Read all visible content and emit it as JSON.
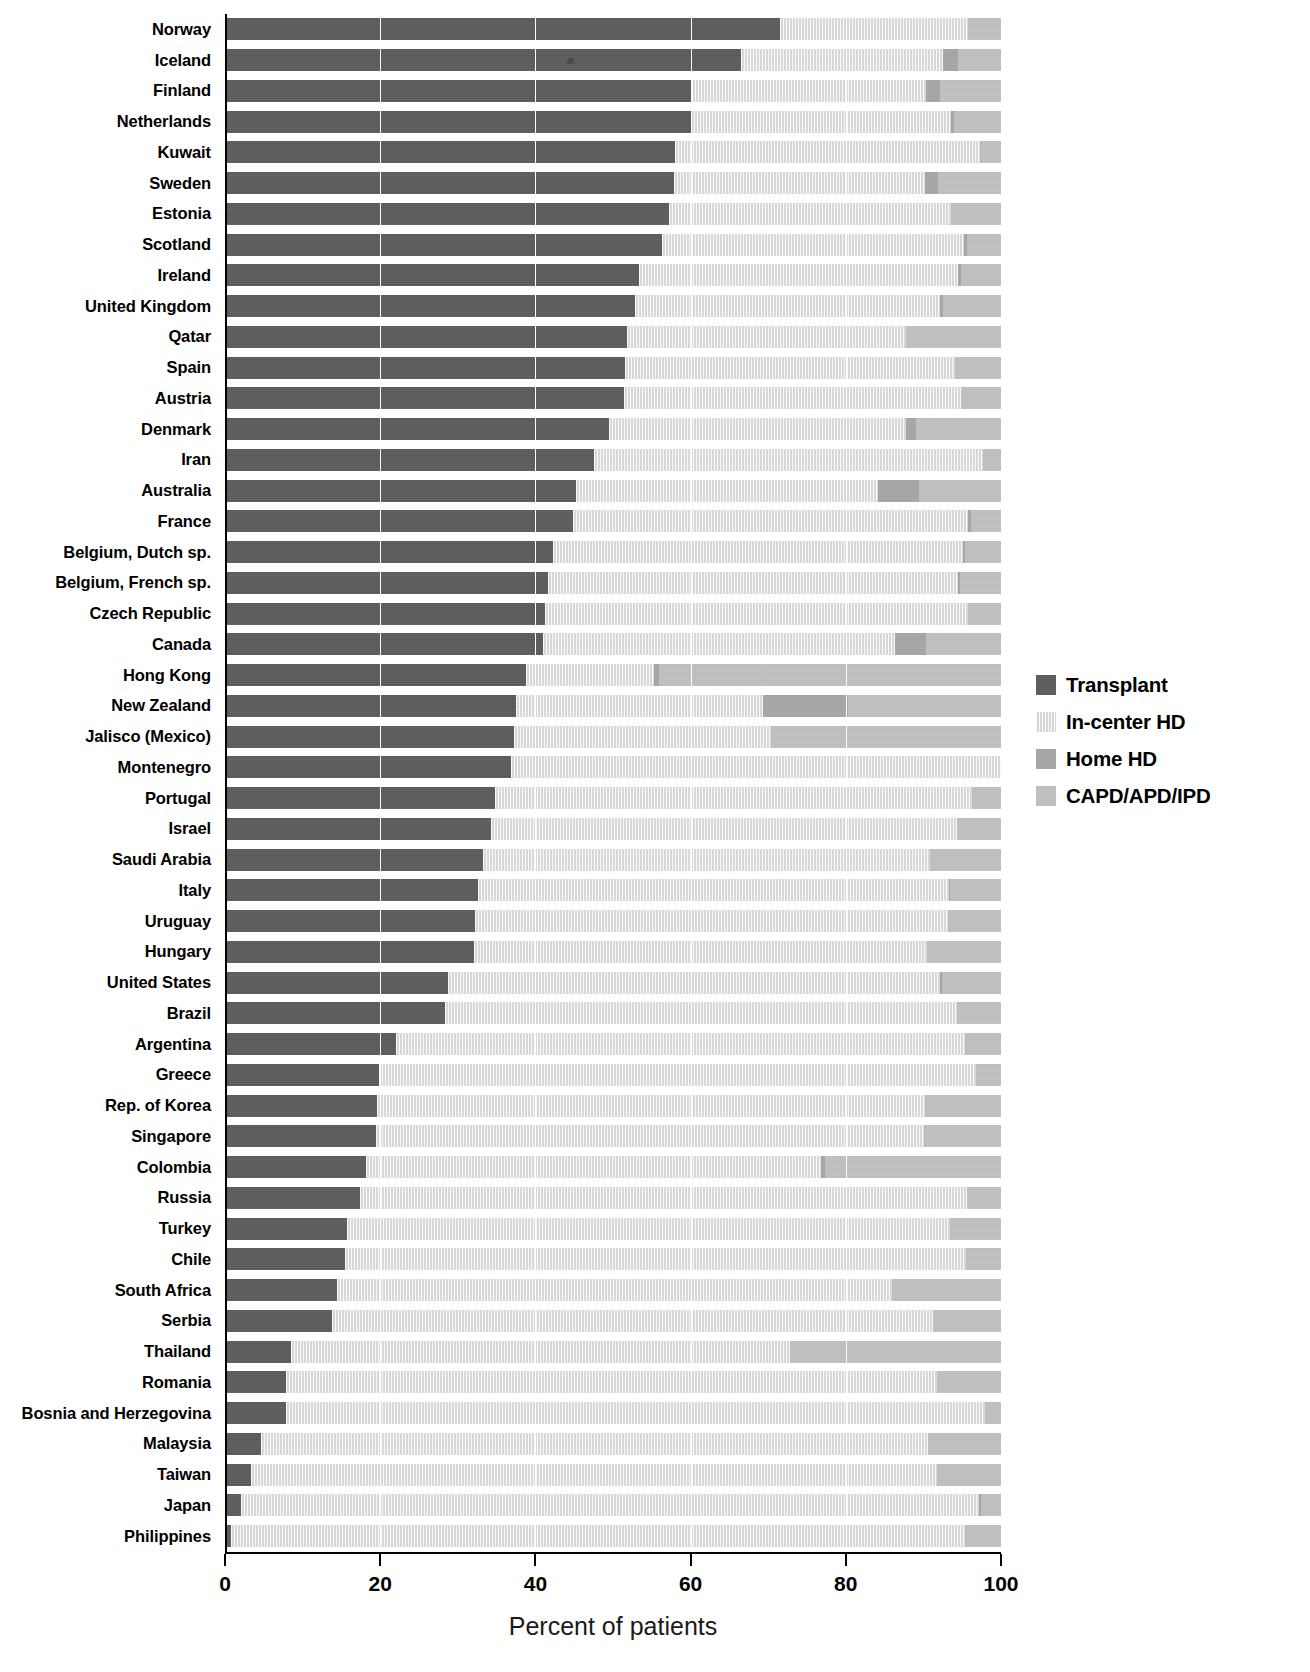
{
  "chart_data": {
    "type": "bar",
    "subtype": "horizontal-stacked-100",
    "title": "",
    "xlabel": "Percent of patients",
    "ylabel": "",
    "xlim": [
      0,
      100
    ],
    "xticks": [
      0,
      20,
      40,
      60,
      80,
      100
    ],
    "grid": true,
    "legend_position": "right",
    "stacked": true,
    "series": [
      {
        "name": "Transplant",
        "color": "#595959",
        "values": [
          71.5,
          66.5,
          60.2,
          60.0,
          58.0,
          57.8,
          57.5,
          56.3,
          53.4,
          52.8,
          51.8,
          51.6,
          51.4,
          49.5,
          47.5,
          45.2,
          44.8,
          42.3,
          41.6,
          41.2,
          41.0,
          38.8,
          37.5,
          37.3,
          36.8,
          34.8,
          34.3,
          33.3,
          32.6,
          32.2,
          32.1,
          28.7,
          28.3,
          22.0,
          19.9,
          19.6,
          19.4,
          18.2,
          17.4,
          15.7,
          15.4,
          14.4,
          13.8,
          8.5,
          7.9,
          7.8,
          4.6,
          3.3,
          2.0,
          0.8
        ]
      },
      {
        "name": "In-center HD",
        "color": "#d8d8d8",
        "values": [
          24.2,
          26.0,
          30.1,
          33.5,
          39.3,
          32.4,
          36.6,
          38.9,
          41.0,
          39.4,
          36.0,
          42.5,
          43.4,
          38.3,
          50.2,
          39.0,
          51.0,
          52.8,
          52.9,
          54.6,
          45.4,
          16.5,
          31.8,
          33.0,
          63.2,
          61.4,
          60.0,
          57.5,
          60.7,
          61.0,
          58.3,
          63.4,
          66.0,
          73.4,
          76.9,
          70.6,
          70.7,
          58.6,
          78.2,
          77.7,
          80.1,
          71.6,
          77.4,
          64.3,
          83.9,
          90.1,
          86.0,
          88.5,
          95.2,
          94.6
        ]
      },
      {
        "name": "Home HD",
        "color": "#a3a3a3",
        "values": [
          0.0,
          2.0,
          1.9,
          0.5,
          0.0,
          1.7,
          0.0,
          0.4,
          0.5,
          0.3,
          0.0,
          0.0,
          0.0,
          1.2,
          0.0,
          5.2,
          0.3,
          0.3,
          0.2,
          0.0,
          4.0,
          0.6,
          11.0,
          0.0,
          0.0,
          0.0,
          0.0,
          0.0,
          0.1,
          0.0,
          0.0,
          0.3,
          0.0,
          0.0,
          0.0,
          0.0,
          0.0,
          0.5,
          0.0,
          0.0,
          0.0,
          0.0,
          0.0,
          0.0,
          0.0,
          0.0,
          0.0,
          0.0,
          0.2,
          0.0
        ]
      },
      {
        "name": "CAPD/APD/IPD",
        "color": "#bdbdbd",
        "values": [
          4.3,
          5.5,
          7.8,
          6.0,
          2.7,
          8.1,
          6.5,
          4.4,
          5.1,
          7.5,
          12.2,
          5.9,
          5.2,
          11.0,
          2.3,
          10.6,
          3.9,
          4.6,
          5.3,
          4.2,
          9.6,
          44.1,
          19.7,
          29.7,
          0.0,
          3.8,
          5.7,
          9.2,
          6.6,
          6.8,
          9.6,
          7.6,
          5.7,
          4.6,
          3.2,
          9.8,
          9.9,
          22.7,
          4.4,
          6.6,
          4.5,
          14.0,
          8.8,
          27.2,
          8.2,
          2.1,
          9.4,
          8.2,
          2.6,
          4.6
        ]
      }
    ],
    "categories": [
      "Norway",
      "Iceland",
      "Finland",
      "Netherlands",
      "Kuwait",
      "Sweden",
      "Estonia",
      "Scotland",
      "Ireland",
      "United Kingdom",
      "Qatar",
      "Spain",
      "Austria",
      "Denmark",
      "Iran",
      "Australia",
      "France",
      "Belgium, Dutch sp.",
      "Belgium, French sp.",
      "Czech Republic",
      "Canada",
      "Hong Kong",
      "New Zealand",
      "Jalisco (Mexico)",
      "Montenegro",
      "Portugal",
      "Israel",
      "Saudi Arabia",
      "Italy",
      "Uruguay",
      "Hungary",
      "United States",
      "Brazil",
      "Argentina",
      "Greece",
      "Rep. of Korea",
      "Singapore",
      "Colombia",
      "Russia",
      "Turkey",
      "Chile",
      "South Africa",
      "Serbia",
      "Thailand",
      "Romania",
      "Bosnia and Herzegovina",
      "Malaysia",
      "Taiwan",
      "Japan",
      "Philippines"
    ]
  },
  "axis": {
    "x_title": "Percent of patients",
    "x_tick_labels": [
      "0",
      "20",
      "40",
      "60",
      "80",
      "100"
    ]
  },
  "legend": {
    "items": [
      {
        "label": "Transplant",
        "color": "#595959"
      },
      {
        "label": "In-center HD",
        "color": "#d8d8d8"
      },
      {
        "label": "Home HD",
        "color": "#a3a3a3"
      },
      {
        "label": "CAPD/APD/IPD",
        "color": "#bdbdbd"
      }
    ]
  }
}
